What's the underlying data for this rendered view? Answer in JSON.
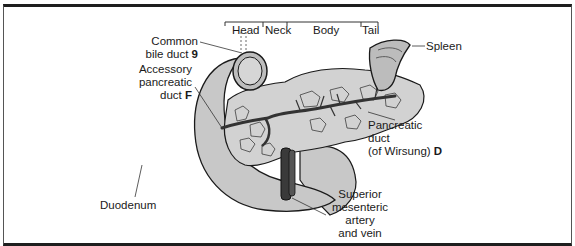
{
  "figure": {
    "regions": {
      "head": "Head",
      "neck": "Neck",
      "body": "Body",
      "tail": "Tail"
    },
    "labels": {
      "common_bile_duct": {
        "line1": "Common",
        "line2": "bile duct",
        "key": "9"
      },
      "accessory_pancreatic_duct": {
        "line1": "Accessory",
        "line2": "pancreatic",
        "line3": "duct",
        "key": "F"
      },
      "spleen": "Spleen",
      "pancreatic_duct": {
        "line1": "Pancreatic",
        "line2": "duct",
        "line3": "(of Wirsung)",
        "key": "D"
      },
      "duodenum": "Duodenum",
      "superior_mesenteric": {
        "line1": "Superior",
        "line2": "mesenteric",
        "line3": "artery",
        "line4": "and vein"
      }
    },
    "colors": {
      "organ_fill": "#c8c8c8",
      "outline": "#1a1a1a",
      "vessel": "#3a3a3a",
      "frame": "#1e1e1e"
    }
  }
}
